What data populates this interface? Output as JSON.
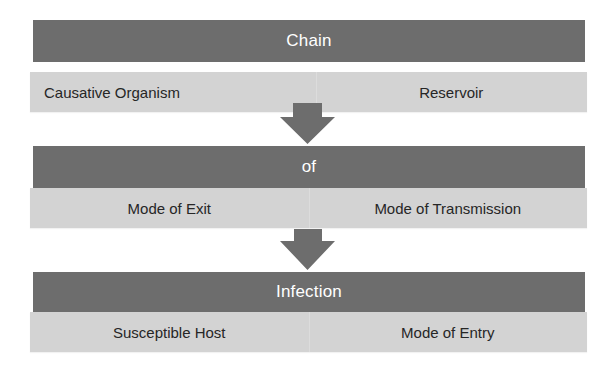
{
  "diagram": {
    "title_parts": [
      "Chain",
      "of",
      "Infection"
    ],
    "blocks": [
      {
        "header": "Chain",
        "items": [
          "Causative Organism",
          "Reservoir"
        ]
      },
      {
        "header": "of",
        "items": [
          "Mode of Exit",
          "Mode of Transmission"
        ]
      },
      {
        "header": "Infection",
        "items": [
          "Susceptible Host",
          "Mode of Entry"
        ]
      }
    ],
    "connectors": [
      {
        "from": "Chain",
        "to": "of",
        "icon": "down-arrow-icon"
      },
      {
        "from": "of",
        "to": "Infection",
        "icon": "down-arrow-icon"
      }
    ],
    "colors": {
      "header_bg": "#6d6d6d",
      "header_text": "#ffffff",
      "item_bg": "#d3d3d3",
      "item_text": "#262626",
      "arrow": "#6d6d6d"
    }
  }
}
